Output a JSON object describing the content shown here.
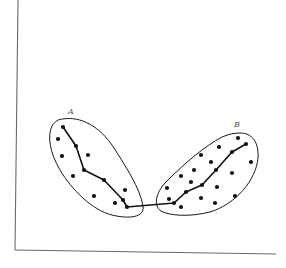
{
  "diagram": {
    "axes": {
      "y_axis": {
        "x1": 18,
        "y1": 0,
        "x2": 15,
        "y2": 250
      },
      "x_axis": {
        "x1": 15,
        "y1": 250,
        "x2": 276,
        "y2": 254
      }
    },
    "clusters": [
      {
        "label": "A",
        "label_pos": {
          "x": 68,
          "y": 114
        },
        "outline_path": "M 63 119 C 80 116, 100 126, 114 148 C 126 167, 140 188, 143 206 C 145 218, 128 219, 112 215 C 92 210, 72 190, 60 170 C 50 153, 47 136, 52 126 C 55 121, 59 119, 63 119 Z",
        "points": [
          {
            "x": 63,
            "y": 127
          },
          {
            "x": 58,
            "y": 139
          },
          {
            "x": 76,
            "y": 146
          },
          {
            "x": 62,
            "y": 156
          },
          {
            "x": 88,
            "y": 155
          },
          {
            "x": 84,
            "y": 170
          },
          {
            "x": 73,
            "y": 176
          },
          {
            "x": 104,
            "y": 180
          },
          {
            "x": 94,
            "y": 196
          },
          {
            "x": 125,
            "y": 190
          },
          {
            "x": 123,
            "y": 200
          },
          {
            "x": 115,
            "y": 203
          },
          {
            "x": 127,
            "y": 207
          }
        ],
        "chain": [
          {
            "x": 63,
            "y": 127
          },
          {
            "x": 76,
            "y": 146
          },
          {
            "x": 84,
            "y": 170
          },
          {
            "x": 104,
            "y": 180
          },
          {
            "x": 123,
            "y": 200
          },
          {
            "x": 127,
            "y": 207
          }
        ]
      },
      {
        "label": "B",
        "label_pos": {
          "x": 234,
          "y": 127
        },
        "outline_path": "M 240 133 C 252 133, 259 142, 258 158 C 256 180, 236 204, 210 212 C 190 217, 170 216, 161 211 C 152 205, 157 190, 168 180 C 185 163, 205 146, 222 137 C 229 134, 235 133, 240 133 Z",
        "points": [
          {
            "x": 238,
            "y": 138
          },
          {
            "x": 246,
            "y": 144
          },
          {
            "x": 219,
            "y": 147
          },
          {
            "x": 232,
            "y": 152
          },
          {
            "x": 201,
            "y": 155
          },
          {
            "x": 211,
            "y": 162
          },
          {
            "x": 251,
            "y": 162
          },
          {
            "x": 194,
            "y": 170
          },
          {
            "x": 216,
            "y": 170
          },
          {
            "x": 232,
            "y": 173
          },
          {
            "x": 181,
            "y": 176
          },
          {
            "x": 191,
            "y": 182
          },
          {
            "x": 202,
            "y": 185
          },
          {
            "x": 217,
            "y": 187
          },
          {
            "x": 167,
            "y": 188
          },
          {
            "x": 186,
            "y": 192
          },
          {
            "x": 235,
            "y": 196
          },
          {
            "x": 201,
            "y": 198
          },
          {
            "x": 169,
            "y": 199
          },
          {
            "x": 174,
            "y": 203
          },
          {
            "x": 215,
            "y": 203
          },
          {
            "x": 181,
            "y": 207
          }
        ],
        "chain": [
          {
            "x": 174,
            "y": 203
          },
          {
            "x": 186,
            "y": 192
          },
          {
            "x": 202,
            "y": 185
          },
          {
            "x": 216,
            "y": 170
          },
          {
            "x": 232,
            "y": 152
          },
          {
            "x": 246,
            "y": 144
          }
        ]
      }
    ],
    "bridge": {
      "from": {
        "x": 127,
        "y": 207
      },
      "to": {
        "x": 174,
        "y": 203
      }
    }
  }
}
